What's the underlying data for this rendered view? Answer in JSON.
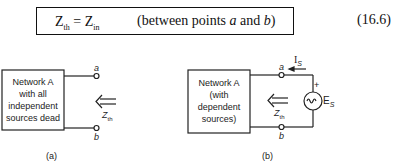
{
  "equation": {
    "lhs_main": "Z",
    "lhs_sub": "th",
    "equals": " = ",
    "rhs_main": "Z",
    "rhs_sub": "in",
    "condition_prefix": "(between points ",
    "point_a": "a",
    "condition_mid": " and ",
    "point_b": "b",
    "condition_suffix": ")",
    "number": "(16.6)"
  },
  "figure_a": {
    "network_lines": [
      "Network A",
      "with all",
      "independent",
      "sources dead"
    ],
    "terminal_a": "a",
    "terminal_b": "b",
    "impedance_main": "Z",
    "impedance_sub": "th",
    "caption": "(a)"
  },
  "figure_b": {
    "network_lines": [
      "Network A",
      "(with",
      "dependent",
      "sources)"
    ],
    "terminal_a": "a",
    "terminal_b": "b",
    "impedance_main": "Z",
    "impedance_sub": "th",
    "current_main": "I",
    "current_sub": "S",
    "source_main": "E",
    "source_sub": "S",
    "polarity": "+",
    "caption": "(b)"
  }
}
